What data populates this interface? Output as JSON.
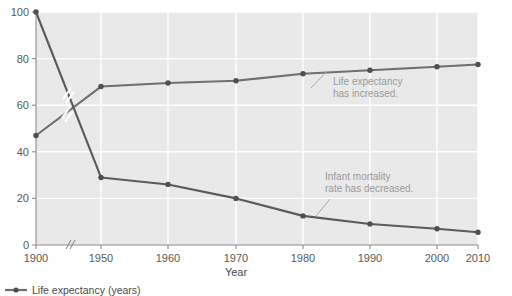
{
  "chart_data": {
    "type": "line",
    "title": "",
    "xlabel": "Year",
    "ylabel": "",
    "grid": true,
    "legend_position": "bottom-left",
    "axis_break": "//",
    "xlim": [
      1900,
      2010
    ],
    "ylim": [
      0,
      100
    ],
    "x": [
      1900,
      1950,
      1960,
      1970,
      1980,
      1990,
      2000,
      2006
    ],
    "xtick_labels": [
      "1900",
      "1950",
      "1960",
      "1970",
      "1980",
      "1990",
      "2000",
      "2010"
    ],
    "ytick_labels": [
      "0",
      "20",
      "40",
      "60",
      "80",
      "100"
    ],
    "ytick_values": [
      0,
      20,
      40,
      60,
      80,
      100
    ],
    "series": [
      {
        "name": "Life expectancy (years)",
        "color": "#6f6f6f",
        "values": [
          47,
          68,
          69.5,
          70.5,
          73.5,
          75,
          76.5,
          77.5
        ]
      },
      {
        "name": "Infant mortality rate",
        "color": "#5a5a5a",
        "values": [
          100,
          29,
          26,
          20,
          12.5,
          9,
          7,
          5.5
        ]
      }
    ],
    "annotations": [
      {
        "id": "life-expectancy-annotation",
        "line1": "Life expectancy",
        "line2": "has increased."
      },
      {
        "id": "infant-mortality-annotation",
        "line1": "Infant mortality",
        "line2": "rate has decreased."
      }
    ]
  },
  "axes": {
    "x_title": "Year"
  },
  "legend": {
    "items": [
      {
        "label": "Life expectancy (years)",
        "color": "#6f6f6f"
      }
    ]
  },
  "colors": {
    "plot_background": "#e9e9e9",
    "gridline": "#ffffff",
    "axis": "#8c8c8c",
    "series_primary": "#6f6f6f",
    "series_secondary": "#5a5a5a",
    "annotation_text": "#9a9a9a"
  }
}
